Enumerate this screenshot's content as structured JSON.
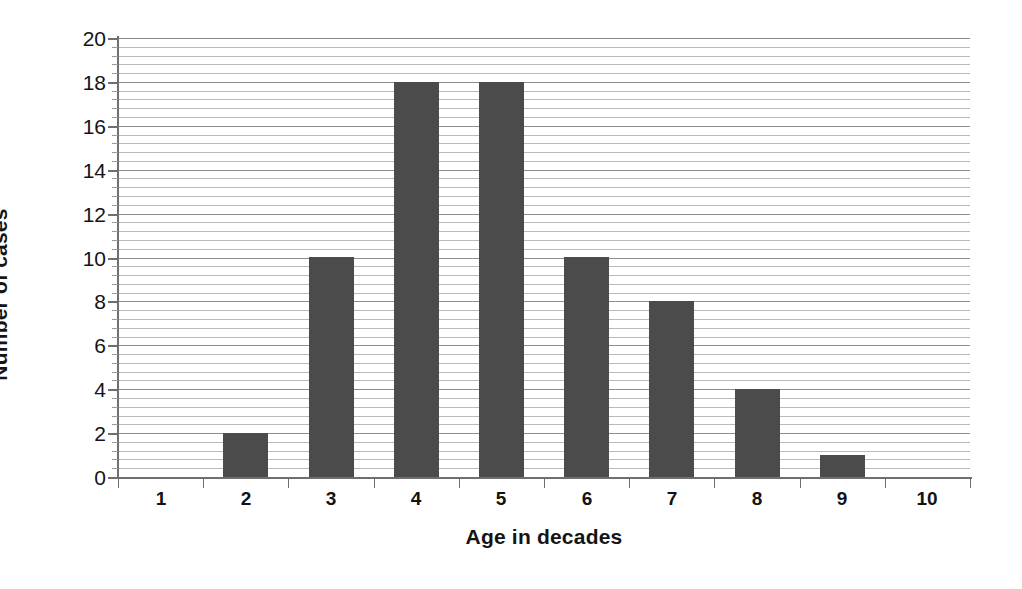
{
  "chart_data": {
    "type": "bar",
    "title": "",
    "subtitle": "",
    "xlabel": "Age in decades",
    "ylabel": "Number of cases",
    "categories": [
      "1",
      "2",
      "3",
      "4",
      "5",
      "6",
      "7",
      "8",
      "9",
      "10"
    ],
    "values": [
      0,
      2,
      10,
      18,
      18,
      10,
      8,
      4,
      1,
      0
    ],
    "series": [
      {
        "name": "Number of cases",
        "values": [
          0,
          2,
          10,
          18,
          18,
          10,
          8,
          4,
          1,
          0
        ]
      }
    ],
    "ylim": [
      0,
      20
    ],
    "y_tick_labels": [
      "0",
      "2",
      "4",
      "6",
      "8",
      "10",
      "12",
      "14",
      "16",
      "18",
      "20"
    ],
    "y_tick_values": [
      0,
      2,
      4,
      6,
      8,
      10,
      12,
      14,
      16,
      18,
      20
    ],
    "y_major_step": 2,
    "y_minor_step": 0.4,
    "x_tick_labels": [
      "1",
      "2",
      "3",
      "4",
      "5",
      "6",
      "7",
      "8",
      "9",
      "10"
    ],
    "grid": true,
    "grid_axis": "y",
    "legend": false,
    "legend_position": "none",
    "annotations": [],
    "colors": {
      "bar": "#4b4b4b",
      "background": "#ffffff",
      "gridline_minor": "#b9b9b9",
      "gridline_major": "#8d8d8d",
      "axis": "#6f6f6f",
      "text": "#141414"
    }
  }
}
